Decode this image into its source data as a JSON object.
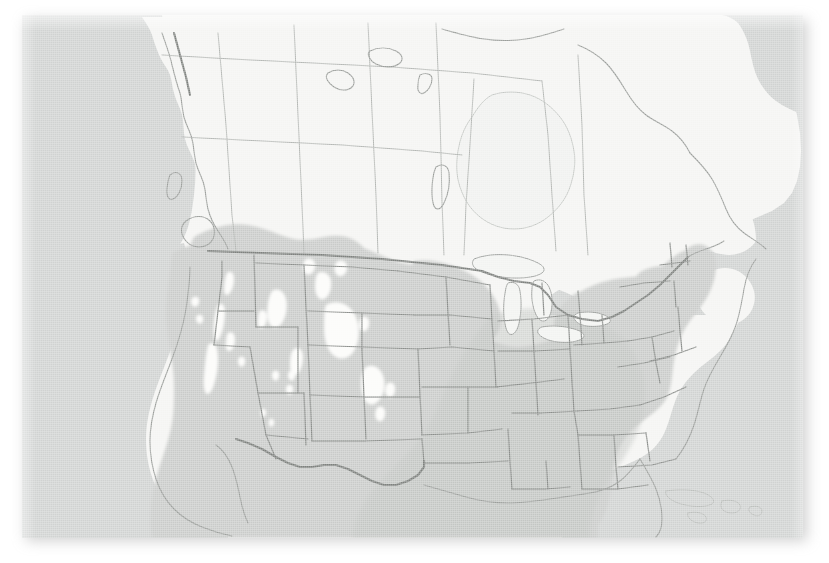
{
  "figure": {
    "kind": "range-map",
    "region": "North America",
    "projection": "conic",
    "has_labels": false,
    "has_legend": false,
    "has_title": false,
    "has_axes": false,
    "has_scale_bar": false,
    "visible_text": ""
  },
  "colors": {
    "page_background": "#ffffff",
    "ocean": "#d0d2d1",
    "land_outside_range": "#f4f4f2",
    "range_shading": "#c9cbc9",
    "range_shading_dark": "#bfc2bf",
    "border_line": "#8a8d8a",
    "coast_line": "#9a9d9a",
    "international_border": "#7e817e",
    "range_gap_fill": "#fbfbf9",
    "plate_shadow": "rgba(140,140,140,0.40)"
  },
  "plate": {
    "left": 22,
    "top": 15,
    "width": 781,
    "height": 523
  },
  "map_layers": [
    {
      "id": "ocean",
      "name": "ocean-background",
      "label": "Ocean"
    },
    {
      "id": "landmass",
      "name": "north-america-landmass",
      "label": "North America landmass"
    },
    {
      "id": "range",
      "name": "species-range-shading",
      "label": "Species distribution range"
    },
    {
      "id": "range-gaps",
      "name": "range-gap-patches",
      "label": "Unoccupied mountain gaps"
    },
    {
      "id": "great-lakes",
      "name": "great-lakes",
      "label": "Great Lakes"
    },
    {
      "id": "state-borders",
      "name": "state-province-borders",
      "label": "State and province borders"
    },
    {
      "id": "country-borders",
      "name": "international-borders",
      "label": "International borders"
    }
  ],
  "chart_data": {
    "type": "map",
    "title": "",
    "subtitle": "",
    "legend": [],
    "annotations": [],
    "range_extent": {
      "north_limit_west": "southern British Columbia / southern Alberta",
      "north_limit_central": "southern South Dakota / Nebraska",
      "north_limit_east": "southern New England coast",
      "south_limit": "extends beyond the southern map edge into Mexico",
      "west_limit": "Pacific coast",
      "east_limit": "Atlantic coast"
    },
    "regions_in_range": [
      "California",
      "Oregon",
      "Washington",
      "Nevada",
      "Idaho",
      "Utah",
      "Arizona",
      "New Mexico",
      "Colorado",
      "Wyoming",
      "Montana (south)",
      "Kansas",
      "Oklahoma",
      "Texas",
      "Missouri",
      "Arkansas",
      "Louisiana",
      "Mississippi",
      "Alabama",
      "Georgia",
      "Florida",
      "South Carolina",
      "North Carolina",
      "Tennessee",
      "Kentucky",
      "Virginia",
      "West Virginia",
      "Maryland",
      "Delaware",
      "New Jersey",
      "Pennsylvania (south)",
      "New York (south)",
      "Connecticut",
      "Rhode Island",
      "Massachusetts (coast)",
      "Mexico",
      "southern British Columbia",
      "southern Alberta"
    ],
    "regions_outside_range": [
      "Alaska",
      "Yukon",
      "Northwest Territories",
      "Nunavut",
      "most of British Columbia",
      "most of Alberta",
      "Saskatchewan",
      "Manitoba",
      "Ontario",
      "Quebec",
      "Labrador",
      "Newfoundland",
      "Maritime Provinces",
      "North Dakota",
      "Minnesota",
      "Wisconsin",
      "Michigan",
      "Iowa",
      "Illinois (north)",
      "Indiana (north)",
      "Ohio (north)",
      "Maine",
      "New Hampshire",
      "Vermont"
    ],
    "range_gaps_note": "White interior patches correspond to high-elevation areas in the Sierra Nevada, Cascade Range, Rocky Mountains, Wasatch and Bitterroot ranges that fall outside the shaded distribution"
  }
}
